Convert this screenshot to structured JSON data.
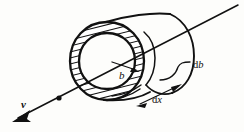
{
  "figure": {
    "background_color": "#fdfdfb",
    "ink_color": "#111111",
    "width": 244,
    "height": 132,
    "labels": {
      "impact_parameter": "b",
      "shell_thickness": "db",
      "shell_thickness_d": "d",
      "shell_thickness_var": "b",
      "length_element": "dx",
      "length_element_d": "d",
      "length_element_var": "x",
      "velocity": "v"
    },
    "annotations": [
      {
        "name": "impact-parameter-label",
        "text": "b",
        "style": "italic",
        "x": 124,
        "y": 75,
        "describes": "radius arrow from cylinder axis to inner circle"
      },
      {
        "name": "shell-thickness-label",
        "text": "db",
        "style": "upright-d-italic-b",
        "x": 198,
        "y": 66,
        "describes": "radial thickness of the hatched annular shell"
      },
      {
        "name": "length-element-label",
        "text": "dx",
        "style": "upright-d-italic-x",
        "x": 158,
        "y": 100,
        "describes": "axial length element of the cylinder, double headed arrow"
      },
      {
        "name": "velocity-label",
        "text": "v",
        "style": "italic-bold",
        "x": 24,
        "y": 104,
        "describes": "velocity vector along the trajectory arrow"
      }
    ],
    "elements": [
      {
        "name": "cylinder-near-end-outer-circle",
        "type": "circle"
      },
      {
        "name": "cylinder-near-end-inner-circle",
        "type": "circle"
      },
      {
        "name": "hatched-annulus",
        "type": "ring",
        "hatch_count": 26
      },
      {
        "name": "cylinder-far-end-ellipse",
        "type": "ellipse"
      },
      {
        "name": "cylinder-top-generator",
        "type": "line"
      },
      {
        "name": "cylinder-bottom-generator",
        "type": "line"
      },
      {
        "name": "trajectory-axis-line",
        "type": "arrow-line"
      },
      {
        "name": "trajectory-arrowhead",
        "type": "arrowhead"
      },
      {
        "name": "axis-point-marker",
        "type": "dot"
      },
      {
        "name": "impact-parameter-arrow",
        "type": "arrow"
      },
      {
        "name": "db-leader-line",
        "type": "curve"
      },
      {
        "name": "dx-double-arrow",
        "type": "double-arrow"
      }
    ]
  }
}
